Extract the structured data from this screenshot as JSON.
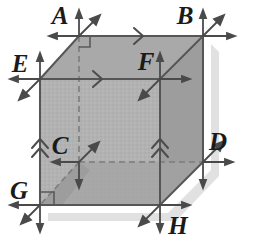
{
  "figure": {
    "type": "geometry-diagram",
    "shape": "cube",
    "canvas": {
      "width": 258,
      "height": 242,
      "background": "#ffffff"
    },
    "colors": {
      "front_face": "#b2b2b2",
      "top_face": "#a8a8a8",
      "right_face": "#9c9c9c",
      "bottom_inner_face": "#a0a0a0",
      "edge_line": "#5a5a5a",
      "hidden_edge_line": "#7a7a7a",
      "arrow": "#4a4a4a",
      "label_text": "#1a1a1a",
      "shadow": "#d8d8d8"
    }
  },
  "vertices": [
    {
      "id": "A",
      "label": "A",
      "x": 79,
      "y": 36,
      "label_x": 60,
      "label_y": 24,
      "hidden": false
    },
    {
      "id": "B",
      "label": "B",
      "x": 203,
      "y": 36,
      "label_x": 185,
      "label_y": 24,
      "hidden": false
    },
    {
      "id": "E",
      "label": "E",
      "x": 40,
      "y": 79,
      "label_x": 20,
      "label_y": 72,
      "hidden": false
    },
    {
      "id": "F",
      "label": "F",
      "x": 160,
      "y": 79,
      "label_x": 143,
      "label_y": 70,
      "hidden": false
    },
    {
      "id": "C",
      "label": "C",
      "x": 79,
      "y": 162,
      "label_x": 58,
      "label_y": 152,
      "hidden": true
    },
    {
      "id": "D",
      "label": "D",
      "x": 203,
      "y": 162,
      "label_x": 212,
      "label_y": 150,
      "hidden": false
    },
    {
      "id": "G",
      "label": "G",
      "x": 40,
      "y": 205,
      "label_x": 15,
      "label_y": 198,
      "hidden": false
    },
    {
      "id": "H",
      "label": "H",
      "x": 160,
      "y": 205,
      "label_x": 172,
      "label_y": 230,
      "hidden": false
    }
  ],
  "edges": [
    {
      "from": "A",
      "to": "B",
      "hidden": false,
      "marker": "single-chevron",
      "marker_dir": "right"
    },
    {
      "from": "E",
      "to": "F",
      "hidden": false,
      "marker": "single-chevron",
      "marker_dir": "right"
    },
    {
      "from": "G",
      "to": "E",
      "hidden": false,
      "marker": "double-chevron",
      "marker_dir": "up"
    },
    {
      "from": "H",
      "to": "F",
      "hidden": false,
      "marker": "double-chevron",
      "marker_dir": "up"
    },
    {
      "from": "A",
      "to": "E",
      "hidden": false,
      "marker": "none",
      "marker_dir": ""
    },
    {
      "from": "B",
      "to": "F",
      "hidden": false,
      "marker": "none",
      "marker_dir": ""
    },
    {
      "from": "B",
      "to": "D",
      "hidden": false,
      "marker": "none",
      "marker_dir": ""
    },
    {
      "from": "F",
      "to": "H",
      "hidden": false,
      "marker": "none",
      "marker_dir": ""
    },
    {
      "from": "E",
      "to": "G",
      "hidden": false,
      "marker": "none",
      "marker_dir": ""
    },
    {
      "from": "G",
      "to": "H",
      "hidden": false,
      "marker": "none",
      "marker_dir": ""
    },
    {
      "from": "H",
      "to": "D",
      "hidden": false,
      "marker": "none",
      "marker_dir": ""
    },
    {
      "from": "A",
      "to": "C",
      "hidden": true,
      "marker": "none",
      "marker_dir": ""
    },
    {
      "from": "C",
      "to": "D",
      "hidden": true,
      "marker": "none",
      "marker_dir": ""
    },
    {
      "from": "C",
      "to": "G",
      "hidden": true,
      "marker": "none",
      "marker_dir": ""
    }
  ],
  "vertex_arrows": {
    "A": [
      "up",
      "left",
      "up-right"
    ],
    "B": [
      "up",
      "right",
      "up-right"
    ],
    "E": [
      "up",
      "left",
      "down-left"
    ],
    "F": [
      "up",
      "right",
      "down-left"
    ],
    "C": [
      "left",
      "down",
      "up-right"
    ],
    "D": [
      "right",
      "down",
      "up-right"
    ],
    "G": [
      "left",
      "down",
      "down-left"
    ],
    "H": [
      "right",
      "down",
      "down-left"
    ]
  },
  "right_angle_marks": [
    {
      "at": "A",
      "x": 79,
      "y": 36
    },
    {
      "at": "G",
      "x": 40,
      "y": 205
    }
  ]
}
